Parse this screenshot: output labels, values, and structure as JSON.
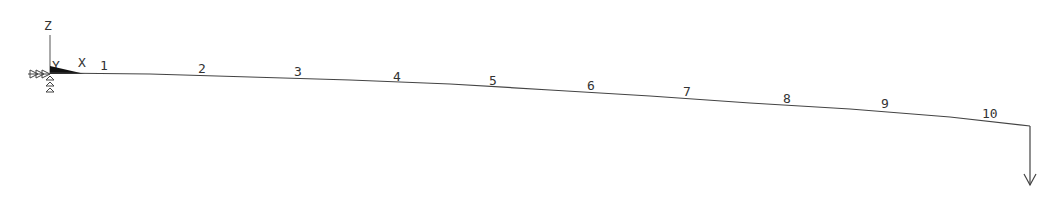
{
  "diagram": {
    "type": "structural-beam-model",
    "colors": {
      "line": "#444444",
      "text": "#333333",
      "background": "#ffffff"
    },
    "axes": {
      "labels": [
        "Z",
        "Y",
        "X"
      ]
    },
    "nodes": [
      {
        "label": "1",
        "x": 104,
        "y": 68
      },
      {
        "label": "2",
        "x": 203,
        "y": 71
      },
      {
        "label": "3",
        "x": 298,
        "y": 74
      },
      {
        "label": "4",
        "x": 398,
        "y": 79
      },
      {
        "label": "5",
        "x": 494,
        "y": 83
      },
      {
        "label": "6",
        "x": 592,
        "y": 88
      },
      {
        "label": "7",
        "x": 688,
        "y": 94
      },
      {
        "label": "8",
        "x": 788,
        "y": 101
      },
      {
        "label": "9",
        "x": 886,
        "y": 106
      },
      {
        "label": "10",
        "x": 990,
        "y": 116
      }
    ],
    "beam_points": "50,73 150,74 250,77 350,80 450,84 550,90 650,96 750,103 850,109 950,117 1030,126",
    "load": {
      "label": "point-load-down"
    }
  }
}
